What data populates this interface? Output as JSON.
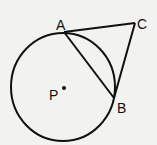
{
  "diagram": {
    "labels": {
      "A": "A",
      "B": "B",
      "C": "C",
      "P": "P"
    },
    "circle": {
      "center_label": "P",
      "cx": 63,
      "cy": 87,
      "r": 53
    },
    "points": {
      "A": {
        "x": 64,
        "y": 32
      },
      "B": {
        "x": 114,
        "y": 98
      },
      "C": {
        "x": 135,
        "y": 23
      },
      "P": {
        "x": 63,
        "y": 87
      }
    },
    "segments": [
      "AC",
      "CB",
      "AB"
    ],
    "colors": {
      "stroke": "#111111",
      "background": "#f2f2f0"
    }
  }
}
